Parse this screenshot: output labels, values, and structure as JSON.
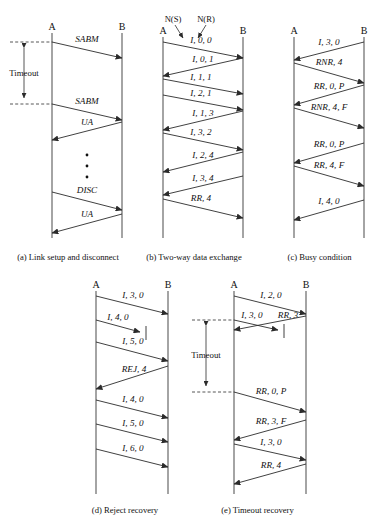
{
  "figure": {
    "nodes": {
      "left": "A",
      "right": "B"
    },
    "timeout_label": "Timeout",
    "annotations": {
      "ns": "N(S)",
      "nr": "N(R)"
    }
  },
  "panels": [
    {
      "id": "a",
      "caption": "(a) Link setup and disconnect",
      "nodes": {
        "left": "A",
        "right": "B"
      },
      "timeout_label": "Timeout",
      "messages": [
        {
          "label": "SABM",
          "dir": "lr"
        },
        {
          "label": "SABM",
          "dir": "lr"
        },
        {
          "label": "UA",
          "dir": "rl"
        },
        {
          "label": "DISC",
          "dir": "lr"
        },
        {
          "label": "UA",
          "dir": "rl"
        }
      ],
      "ellipsis_dots": 3
    },
    {
      "id": "b",
      "caption": "(b) Two-way data exchange",
      "nodes": {
        "left": "A",
        "right": "B"
      },
      "annotations": {
        "ns": "N(S)",
        "nr": "N(R)"
      },
      "messages": [
        {
          "label": "I, 0, 0",
          "dir": "lr"
        },
        {
          "label": "I, 0, 1",
          "dir": "rl"
        },
        {
          "label": "I, 1, 1",
          "dir": "lr"
        },
        {
          "label": "I, 2, 1",
          "dir": "lr"
        },
        {
          "label": "I, 1, 3",
          "dir": "rl"
        },
        {
          "label": "I, 3, 2",
          "dir": "lr"
        },
        {
          "label": "I, 2, 4",
          "dir": "rl"
        },
        {
          "label": "I, 3, 4",
          "dir": "rl"
        },
        {
          "label": "RR, 4",
          "dir": "lr"
        }
      ]
    },
    {
      "id": "c",
      "caption": "(c) Busy condition",
      "nodes": {
        "left": "A",
        "right": "B"
      },
      "messages": [
        {
          "label": "I, 3, 0",
          "dir": "rl"
        },
        {
          "label": "RNR, 4",
          "dir": "lr"
        },
        {
          "label": "RR, 0, P",
          "dir": "rl"
        },
        {
          "label": "RNR, 4, F",
          "dir": "lr"
        },
        {
          "label": "RR, 0, P",
          "dir": "rl"
        },
        {
          "label": "RR, 4, F",
          "dir": "lr"
        },
        {
          "label": "I, 4, 0",
          "dir": "rl"
        }
      ]
    },
    {
      "id": "d",
      "caption": "(d) Reject recovery",
      "nodes": {
        "left": "A",
        "right": "B"
      },
      "messages": [
        {
          "label": "I, 3, 0",
          "dir": "lr"
        },
        {
          "label": "I, 4, 0",
          "dir": "lr",
          "lost": true
        },
        {
          "label": "I, 5, 0",
          "dir": "lr"
        },
        {
          "label": "REJ, 4",
          "dir": "rl"
        },
        {
          "label": "I, 4, 0",
          "dir": "lr"
        },
        {
          "label": "I, 5, 0",
          "dir": "lr"
        },
        {
          "label": "I, 6, 0",
          "dir": "lr"
        }
      ]
    },
    {
      "id": "e",
      "caption": "(e) Timeout recovery",
      "nodes": {
        "left": "A",
        "right": "B"
      },
      "timeout_label": "Timeout",
      "messages": [
        {
          "label": "I, 2, 0",
          "dir": "lr"
        },
        {
          "label": "I, 3, 0",
          "dir": "lr",
          "lost": true
        },
        {
          "label": "RR, 3",
          "dir": "rl"
        },
        {
          "label": "RR, 0, P",
          "dir": "lr"
        },
        {
          "label": "RR, 3, F",
          "dir": "rl"
        },
        {
          "label": "I, 3, 0",
          "dir": "lr"
        },
        {
          "label": "RR, 4",
          "dir": "rl"
        }
      ]
    }
  ]
}
